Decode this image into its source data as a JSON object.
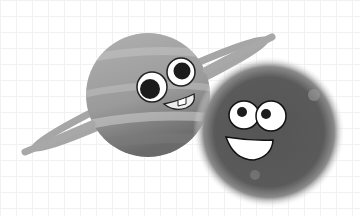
{
  "illustration": {
    "subject": "Two cartoon planets with faces",
    "characters": [
      {
        "name": "ringed-planet",
        "description": "Gray ringed planet with googly eyes and toothy grin"
      },
      {
        "name": "glowing-planet",
        "description": "Dark glowing planet with googly eyes and wide smile"
      }
    ]
  },
  "colors": {
    "background": "#ffffff",
    "ringed_planet": "#9a9a9a",
    "ring": "#a8a8a8",
    "glowing_planet": "#575757",
    "eye_white": "#ffffff",
    "pupil": "#1c1c1c",
    "outline": "#222222"
  }
}
